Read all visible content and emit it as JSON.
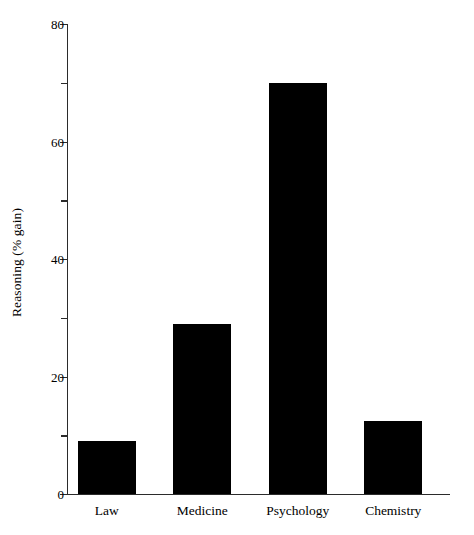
{
  "chart_data": {
    "type": "bar",
    "title": "",
    "subtitle": "",
    "xlabel": "",
    "ylabel": "Reasoning (% gain)",
    "categories": [
      "Law",
      "Medicine",
      "Psychology",
      "Chemistry"
    ],
    "values": [
      9,
      29,
      70,
      12.5
    ],
    "series": [
      {
        "name": "Reasoning (% gain)",
        "values": [
          9,
          29,
          70,
          12.5
        ]
      }
    ],
    "ylim": [
      0,
      80
    ],
    "xlim": [
      0,
      4
    ],
    "y_major_ticks": [
      0,
      20,
      40,
      60,
      80
    ],
    "y_major_tick_labels": [
      "0",
      "20",
      "40",
      "60",
      "80"
    ],
    "y_minor_ticks": [
      10,
      30,
      50,
      70
    ],
    "grid": false,
    "legend": null,
    "legend_position": "none",
    "bar_color": "#000000",
    "axis_color": "#2b2b2b",
    "background_color": "#ffffff",
    "spines": [
      "left",
      "bottom"
    ],
    "annotations": []
  }
}
